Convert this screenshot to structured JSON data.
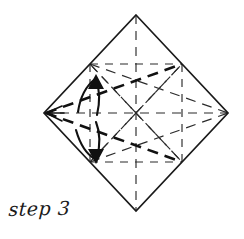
{
  "figure": {
    "title": "step 3",
    "caption": "step 3",
    "background_color": "#ffffff",
    "line_color": "#1a1a1a",
    "fold_line_color": "#2b2b2b",
    "crease_line_color": "#111111",
    "arrow_color": "#111111"
  },
  "geometry": {
    "vertices": {
      "top": {
        "x": 136,
        "y": 15,
        "label": "top-vertex"
      },
      "right": {
        "x": 228,
        "y": 113,
        "label": "right-vertex"
      },
      "bottom": {
        "x": 136,
        "y": 211,
        "label": "bottom-vertex"
      },
      "left": {
        "x": 44,
        "y": 113,
        "label": "left-vertex"
      }
    },
    "midpoints": {
      "upper_left": {
        "x": 90,
        "y": 64,
        "label": "upper-left-midpoint"
      },
      "upper_right": {
        "x": 182,
        "y": 64,
        "label": "upper-right-midpoint"
      },
      "lower_right": {
        "x": 182,
        "y": 162,
        "label": "lower-right-midpoint"
      },
      "lower_left": {
        "x": 90,
        "y": 162,
        "label": "lower-left-midpoint"
      }
    },
    "center": {
      "x": 136,
      "y": 113,
      "label": "center-point"
    }
  },
  "outline": {
    "name": "square-sheet-outline",
    "points": "136,15 228,113 136,211 44,113",
    "stroke_width": 1.6
  },
  "fold_lines": [
    {
      "name": "vertical-axis-crease",
      "x1": 136,
      "y1": 15,
      "x2": 136,
      "y2": 211,
      "style": "dashed-thin"
    },
    {
      "name": "horizontal-axis-crease",
      "x1": 44,
      "y1": 113,
      "x2": 228,
      "y2": 113,
      "style": "dashed-thin"
    },
    {
      "name": "inner-square-top-left-edge",
      "x1": 90,
      "y1": 64,
      "x2": 182,
      "y2": 64,
      "style": "dashed-thin"
    },
    {
      "name": "inner-square-bottom-edge",
      "x1": 90,
      "y1": 162,
      "x2": 182,
      "y2": 162,
      "style": "dashed-thin"
    },
    {
      "name": "inner-square-left-edge",
      "x1": 90,
      "y1": 64,
      "x2": 90,
      "y2": 162,
      "style": "dashed-thin"
    },
    {
      "name": "inner-square-right-edge",
      "x1": 182,
      "y1": 64,
      "x2": 182,
      "y2": 162,
      "style": "dashed-thin"
    },
    {
      "name": "star-ray-upper-left",
      "x1": 136,
      "y1": 113,
      "x2": 90,
      "y2": 64,
      "style": "dashed-thin"
    },
    {
      "name": "star-ray-upper-right",
      "x1": 136,
      "y1": 113,
      "x2": 182,
      "y2": 64,
      "style": "dashed-thin"
    },
    {
      "name": "star-ray-lower-right",
      "x1": 136,
      "y1": 113,
      "x2": 182,
      "y2": 162,
      "style": "dashed-thin"
    },
    {
      "name": "star-ray-lower-left",
      "x1": 136,
      "y1": 113,
      "x2": 90,
      "y2": 162,
      "style": "dashed-thin"
    },
    {
      "name": "diagonal-left-to-upper-right",
      "x1": 44,
      "y1": 113,
      "x2": 182,
      "y2": 64,
      "style": "dashed-bold"
    },
    {
      "name": "diagonal-left-to-lower-right",
      "x1": 44,
      "y1": 113,
      "x2": 182,
      "y2": 162,
      "style": "dashed-bold"
    },
    {
      "name": "diagonal-upper-left-to-right",
      "x1": 90,
      "y1": 64,
      "x2": 228,
      "y2": 113,
      "style": "dashed-thin"
    },
    {
      "name": "diagonal-lower-left-to-right",
      "x1": 90,
      "y1": 162,
      "x2": 228,
      "y2": 113,
      "style": "dashed-thin"
    },
    {
      "name": "crease-upper-left-to-lower-right",
      "x1": 90,
      "y1": 64,
      "x2": 182,
      "y2": 162,
      "style": "dashed-thin"
    },
    {
      "name": "crease-lower-left-to-upper-right",
      "x1": 90,
      "y1": 162,
      "x2": 182,
      "y2": 64,
      "style": "dashed-thin"
    }
  ],
  "arrows": [
    {
      "name": "fold-arrow-upward",
      "direction": "up",
      "path": "M 80 108 C 84 92 90 82 96 78",
      "head": "96,76 89,88 103,89",
      "tail_path": "M 96 78 C 100 86 100 98 97 110"
    },
    {
      "name": "fold-arrow-downward",
      "direction": "down",
      "path": "M 78 134 C 84 146 90 154 96 158",
      "head": "97,162 90,148 104,149",
      "tail_path": "M 96 124 C 100 132 100 146 97 158"
    }
  ]
}
